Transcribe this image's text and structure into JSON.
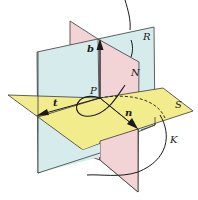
{
  "diagram": {
    "type": "3d-planes-frenet-frame",
    "planes": [
      {
        "name": "R",
        "label": "R",
        "role": "rectifying plane",
        "color": "#d6ecec"
      },
      {
        "name": "N",
        "label": "N",
        "role": "normal plane",
        "color": "#f2d4d6"
      },
      {
        "name": "S",
        "label": "S",
        "role": "osculating plane",
        "color": "#f3ec8c"
      }
    ],
    "point": {
      "label": "P"
    },
    "vectors": [
      {
        "label": "t",
        "role": "tangent"
      },
      {
        "label": "n",
        "role": "principal normal"
      },
      {
        "label": "b",
        "role": "binormal"
      }
    ],
    "curve": {
      "label": "K"
    },
    "colors": {
      "edge": "#3a3a3a",
      "curve": "#1a1a1a",
      "plane_R": "#d6ecec",
      "plane_N": "#f2d4d6",
      "plane_S": "#f3ec8c"
    }
  }
}
